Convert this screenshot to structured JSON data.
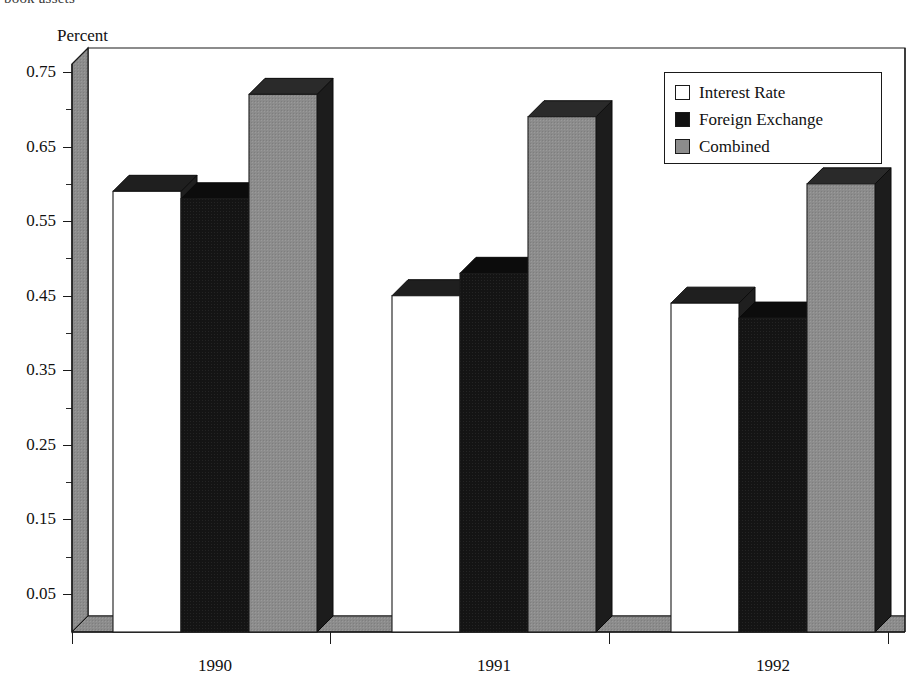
{
  "caption": {
    "clipped_top_line": "book assets"
  },
  "chart_data": {
    "type": "bar",
    "title": "",
    "subtitle": "",
    "ylabel": "Percent",
    "xlabel": "",
    "ylim": [
      0.0,
      0.78
    ],
    "ytick_labels": [
      "0.75",
      "0.65",
      "0.55",
      "0.45",
      "0.35",
      "0.25",
      "0.15",
      "0.05"
    ],
    "ytick_values": [
      0.75,
      0.65,
      0.55,
      0.45,
      0.35,
      0.25,
      0.15,
      0.05
    ],
    "minor_ticks": [
      0.7,
      0.6,
      0.5,
      0.4,
      0.3,
      0.2,
      0.1
    ],
    "grid": false,
    "legend_position": "top-right",
    "style": "3d-bars",
    "categories": [
      "1990",
      "1991",
      "1992"
    ],
    "series": [
      {
        "name": "Interest Rate",
        "color": "#ffffff",
        "values": [
          0.59,
          0.45,
          0.44
        ]
      },
      {
        "name": "Foreign Exchange",
        "color": "#111111",
        "values": [
          0.58,
          0.48,
          0.42
        ]
      },
      {
        "name": "Combined",
        "color": "#8c8c8c",
        "values": [
          0.72,
          0.69,
          0.6
        ]
      }
    ]
  },
  "legend": {
    "entries": [
      {
        "label": "Interest Rate"
      },
      {
        "label": "Foreign Exchange"
      },
      {
        "label": "Combined"
      }
    ]
  },
  "colors": {
    "interest_rate": "#ffffff",
    "foreign_exchange": "#111111",
    "combined": "#8c8c8c",
    "axis": "#1a1a1a",
    "depth_shade": "#707070"
  }
}
